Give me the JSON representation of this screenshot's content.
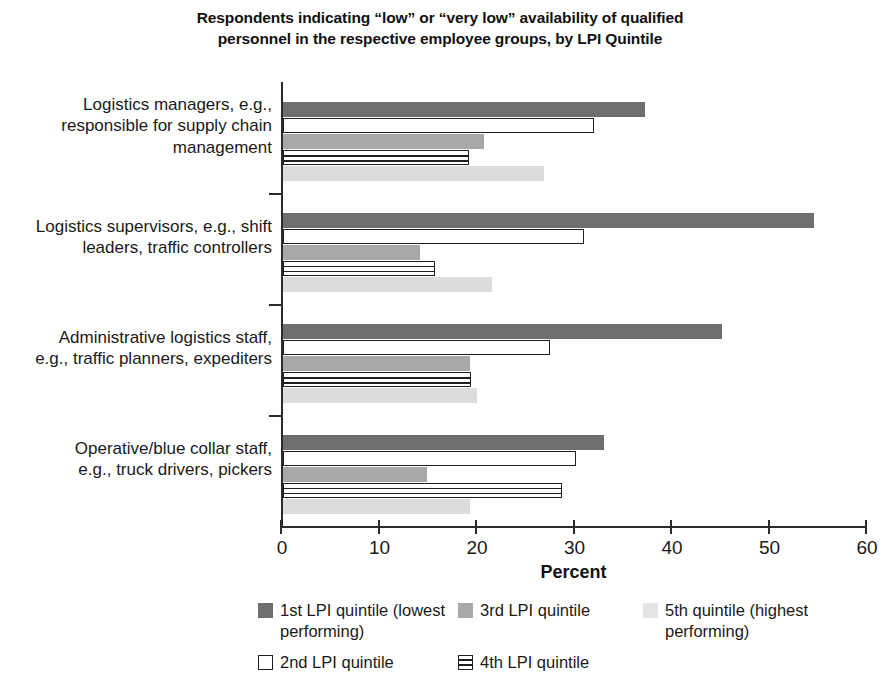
{
  "chart_data": {
    "type": "bar",
    "orientation": "horizontal",
    "title": "Respondents indicating “low” or “very low” availability of qualified personnel in the respective employee groups, by LPI Quintile",
    "title_line_1": "Respondents indicating “low” or “very low” availability of qualified",
    "title_line_2": "personnel in the respective employee groups, by LPI Quintile",
    "xlabel": "Percent",
    "ylabel": "",
    "xlim": [
      0,
      60
    ],
    "xticks": [
      "0",
      "10",
      "20",
      "30",
      "40",
      "50",
      "60"
    ],
    "grid": false,
    "legend_position": "bottom",
    "categories": [
      "Logistics managers, e.g., responsible for supply chain management",
      "Logistics supervisors, e.g., shift leaders, traffic controllers",
      "Administrative logistics staff, e.g., traffic planners, expediters",
      "Operative/blue collar staff, e.g., truck drivers, pickers"
    ],
    "category_lines": [
      [
        "Logistics managers, e.g.,",
        "responsible for supply chain",
        "management"
      ],
      [
        "Logistics supervisors, e.g., shift",
        "leaders, traffic controllers"
      ],
      [
        "Administrative logistics staff,",
        "e.g., traffic planners, expediters"
      ],
      [
        "Operative/blue collar staff,",
        "e.g., truck drivers, pickers"
      ]
    ],
    "series": [
      {
        "name": "1st LPI quintile (lowest performing)",
        "key": "q1",
        "color": "#6e6e6e",
        "values": [
          37.1,
          54.5,
          45.0,
          32.9
        ]
      },
      {
        "name": "2nd LPI quintile",
        "key": "q2",
        "color": "#ffffff",
        "values": [
          31.9,
          30.9,
          27.4,
          30.0
        ]
      },
      {
        "name": "3rd LPI quintile",
        "key": "q3",
        "color": "#a8a8a8",
        "values": [
          20.6,
          14.0,
          19.2,
          14.8
        ]
      },
      {
        "name": "4th LPI quintile",
        "key": "q4",
        "color": "#ffffff",
        "values": [
          19.1,
          15.6,
          19.3,
          28.6
        ]
      },
      {
        "name": "5th quintile (highest performing)",
        "key": "q5",
        "color": "#dcdcdc",
        "values": [
          26.8,
          21.4,
          19.9,
          19.2
        ]
      }
    ]
  },
  "legend": {
    "entries": [
      {
        "key": "q1",
        "label": "1st LPI quintile (lowest performing)",
        "col": 1,
        "row": 1
      },
      {
        "key": "q2",
        "label": "2nd LPI quintile",
        "col": 1,
        "row": 2
      },
      {
        "key": "q3",
        "label": "3rd LPI quintile",
        "col": 2,
        "row": 1
      },
      {
        "key": "q4",
        "label": "4th LPI quintile",
        "col": 2,
        "row": 2
      },
      {
        "key": "q5",
        "label": "5th quintile (highest performing)",
        "col": 3,
        "row": 1
      }
    ]
  }
}
